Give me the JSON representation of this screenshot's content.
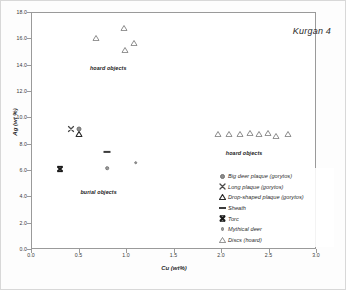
{
  "chart_data": {
    "type": "scatter",
    "title": "Kurgan 4",
    "xlabel": "Cu (wt%)",
    "ylabel": "Ag (wt %)",
    "xlim": [
      0.0,
      3.0
    ],
    "ylim": [
      0.0,
      18.0
    ],
    "xticks": [
      "0.0",
      "0.5",
      "1.0",
      "1.5",
      "2.0",
      "2.5",
      "3.0"
    ],
    "yticks": [
      "0.0",
      "2.0",
      "4.0",
      "6.0",
      "8.0",
      "10.0",
      "12.0",
      "14.0",
      "16.0",
      "18.0"
    ],
    "grid": false,
    "legend_position": "bottom-right",
    "annotations": [
      {
        "text": "hoard objects",
        "x": 0.62,
        "y": 14.0
      },
      {
        "text": "hoard objects",
        "x": 2.05,
        "y": 7.5
      },
      {
        "text": "burial objects",
        "x": 0.52,
        "y": 4.55
      }
    ],
    "series": [
      {
        "name": "Big deer plaque (gorytos)",
        "marker": "circle",
        "points": [
          {
            "x": 0.5,
            "y": 9.1
          }
        ]
      },
      {
        "name": "Long plaque (gorytos)",
        "marker": "x",
        "points": [
          {
            "x": 0.42,
            "y": 9.15
          }
        ]
      },
      {
        "name": "Drop-shaped plaque (gorytos)",
        "marker": "triangle-dark",
        "points": [
          {
            "x": 0.5,
            "y": 8.75
          }
        ]
      },
      {
        "name": "Sheath",
        "marker": "dash",
        "points": [
          {
            "x": 0.8,
            "y": 7.35
          }
        ]
      },
      {
        "name": "Torc",
        "marker": "bowtie",
        "points": [
          {
            "x": 0.3,
            "y": 6.1
          }
        ]
      },
      {
        "name": "Mythical deer",
        "marker": "circle-small",
        "points": [
          {
            "x": 0.8,
            "y": 6.15
          },
          {
            "x": 1.1,
            "y": 6.55
          }
        ]
      },
      {
        "name": "Discs (hoard)",
        "marker": "triangle",
        "points": [
          {
            "x": 0.68,
            "y": 16.05
          },
          {
            "x": 0.98,
            "y": 16.75
          },
          {
            "x": 0.99,
            "y": 15.15
          },
          {
            "x": 1.08,
            "y": 15.65
          },
          {
            "x": 1.97,
            "y": 8.75
          },
          {
            "x": 2.08,
            "y": 8.75
          },
          {
            "x": 2.2,
            "y": 8.75
          },
          {
            "x": 2.3,
            "y": 8.8
          },
          {
            "x": 2.4,
            "y": 8.75
          },
          {
            "x": 2.49,
            "y": 8.8
          },
          {
            "x": 2.58,
            "y": 8.6
          },
          {
            "x": 2.7,
            "y": 8.7
          }
        ]
      }
    ]
  },
  "legend": {
    "items": [
      {
        "label": "Big deer plaque (gorytos)",
        "marker": "circle"
      },
      {
        "label": "Long plaque (gorytos)",
        "marker": "x"
      },
      {
        "label": "Drop-shaped plaque (gorytos)",
        "marker": "triangle-dark"
      },
      {
        "label": "Sheath",
        "marker": "dash"
      },
      {
        "label": "Torc",
        "marker": "bowtie"
      },
      {
        "label": "Mythical deer",
        "marker": "circle-small"
      },
      {
        "label": "Discs (hoard)",
        "marker": "triangle"
      }
    ]
  }
}
